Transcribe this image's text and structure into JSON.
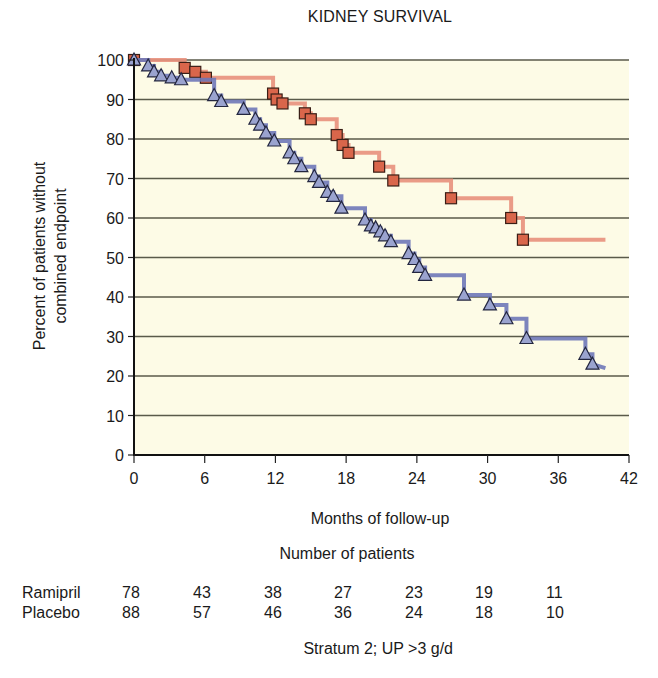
{
  "chart_data": {
    "type": "line",
    "subtype": "kaplan-meier step",
    "title": "KIDNEY SURVIVAL",
    "xlabel": "Months of follow-up",
    "ylabel": "Percent of patients without combined endpoint",
    "ylabel_lines": [
      "Percent of patients without",
      "combined endpoint"
    ],
    "xlim": [
      0,
      42
    ],
    "ylim": [
      0,
      100
    ],
    "x_ticks": [
      0,
      6,
      12,
      18,
      24,
      30,
      36,
      42
    ],
    "y_ticks": [
      0,
      10,
      20,
      30,
      40,
      50,
      60,
      70,
      80,
      90,
      100
    ],
    "grid": "horizontal",
    "plot_background": "#fdfbe6",
    "legend": "none (series identified in number-at-risk table)",
    "series": [
      {
        "name": "Ramipril",
        "color": "#e07a5f",
        "line_color": "#e8907c",
        "marker": "square",
        "marker_fill": "#d9664b",
        "steps": [
          [
            0,
            100
          ],
          [
            4.3,
            98
          ],
          [
            5.2,
            97
          ],
          [
            6.1,
            95.5
          ],
          [
            11.8,
            91.5
          ],
          [
            12.1,
            90
          ],
          [
            12.6,
            89
          ],
          [
            14.5,
            86.5
          ],
          [
            15.0,
            85
          ],
          [
            17.2,
            81
          ],
          [
            17.7,
            78.5
          ],
          [
            18.2,
            76.5
          ],
          [
            20.8,
            73
          ],
          [
            22.0,
            69.5
          ],
          [
            26.9,
            65
          ],
          [
            32.0,
            60
          ],
          [
            33.0,
            54.5
          ]
        ],
        "end_x": 40,
        "end_y": 54.5
      },
      {
        "name": "Placebo",
        "color": "#8a93c8",
        "line_color": "#6f78b8",
        "marker": "triangle",
        "marker_fill": "#9aa3cf",
        "steps": [
          [
            0,
            100
          ],
          [
            1.2,
            98.5
          ],
          [
            1.7,
            97
          ],
          [
            2.3,
            96
          ],
          [
            3.2,
            95.5
          ],
          [
            4.0,
            95
          ],
          [
            6.8,
            91
          ],
          [
            7.4,
            89.5
          ],
          [
            9.3,
            87.5
          ],
          [
            10.3,
            85
          ],
          [
            10.7,
            83.5
          ],
          [
            11.2,
            81.5
          ],
          [
            11.9,
            79.5
          ],
          [
            13.2,
            76.5
          ],
          [
            13.6,
            75
          ],
          [
            14.2,
            73
          ],
          [
            15.3,
            70.5
          ],
          [
            15.7,
            69
          ],
          [
            16.4,
            66.5
          ],
          [
            16.9,
            65.5
          ],
          [
            17.6,
            62.5
          ],
          [
            19.6,
            59.5
          ],
          [
            20.1,
            58
          ],
          [
            20.5,
            57.5
          ],
          [
            20.9,
            56.5
          ],
          [
            21.3,
            55.5
          ],
          [
            21.8,
            54
          ],
          [
            23.3,
            51
          ],
          [
            23.8,
            49.5
          ],
          [
            24.2,
            47.5
          ],
          [
            24.7,
            45.5
          ],
          [
            28.0,
            40.5
          ],
          [
            30.2,
            38
          ],
          [
            31.6,
            34.5
          ],
          [
            33.3,
            29.5
          ],
          [
            38.3,
            25.5
          ],
          [
            38.9,
            23
          ]
        ],
        "end_x": 40,
        "end_y": 22
      }
    ],
    "number_at_risk": {
      "title": "Number of patients",
      "timepoints": [
        0,
        6,
        12,
        18,
        24,
        30,
        36
      ],
      "rows": [
        {
          "label": "Ramipril",
          "values": [
            78,
            43,
            38,
            27,
            23,
            19,
            11
          ]
        },
        {
          "label": "Placebo",
          "values": [
            88,
            57,
            46,
            36,
            24,
            18,
            10
          ]
        }
      ]
    },
    "annotation": "Stratum 2; UP >3 g/d"
  },
  "figure": {
    "title": "KIDNEY SURVIVAL",
    "xlabel": "Months of follow-up",
    "ylabel_line1": "Percent of patients without",
    "ylabel_line2": "combined endpoint",
    "risk_title": "Number of patients",
    "ramipril_label": "Ramipril",
    "placebo_label": "Placebo",
    "ramipril_values": [
      "78",
      "43",
      "38",
      "27",
      "23",
      "19",
      "11"
    ],
    "placebo_values": [
      "88",
      "57",
      "46",
      "36",
      "24",
      "18",
      "10"
    ],
    "stratum_note": "Stratum 2; UP >3 g/d"
  }
}
